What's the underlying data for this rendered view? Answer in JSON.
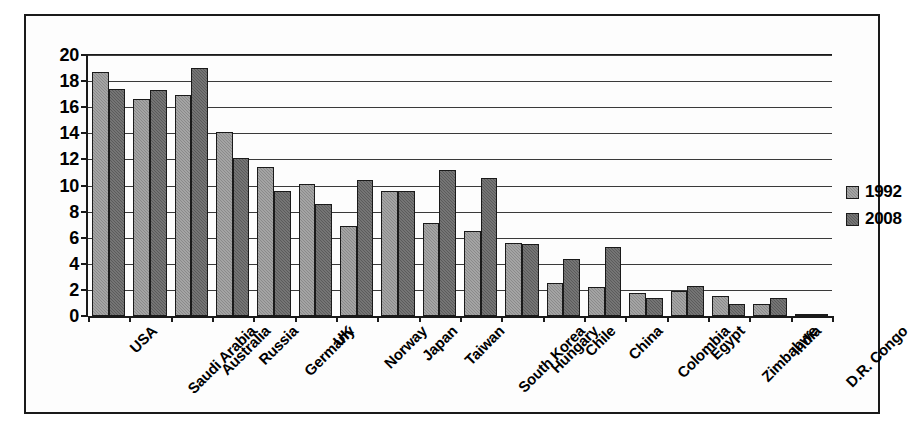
{
  "chart_data": {
    "type": "bar",
    "title": "",
    "subtitle": "",
    "xlabel": "",
    "ylabel": "",
    "ylim": [
      0,
      20
    ],
    "ytick_values": [
      0,
      2,
      4,
      6,
      8,
      10,
      12,
      14,
      16,
      18,
      20
    ],
    "ytick_labels": [
      "0",
      "2",
      "4",
      "6",
      "8",
      "10",
      "12",
      "14",
      "16",
      "18",
      "20"
    ],
    "grid": true,
    "grid_axis": "y",
    "legend_position": "right",
    "orientation": "vertical",
    "categories": [
      "USA",
      "Saudi Arabia",
      "Australia",
      "Russia",
      "Germany",
      "UK",
      "Norway",
      "Japan",
      "Taiwan",
      "South Korea",
      "Hungary",
      "Chile",
      "China",
      "Colombia",
      "Egypt",
      "Zimbabwe",
      "India",
      "D.R. Congo"
    ],
    "series": [
      {
        "name": "1992",
        "color": "#8a8a8a",
        "values": [
          18.7,
          16.6,
          16.9,
          14.1,
          11.4,
          10.1,
          6.9,
          9.6,
          7.1,
          6.5,
          5.6,
          2.5,
          2.2,
          1.8,
          1.9,
          1.5,
          0.9,
          0.05
        ]
      },
      {
        "name": "2008",
        "color": "#5b5b5b",
        "values": [
          17.4,
          17.3,
          19.0,
          12.1,
          9.6,
          8.6,
          10.4,
          9.6,
          11.2,
          10.6,
          5.5,
          4.4,
          5.3,
          1.4,
          2.3,
          0.9,
          1.4,
          0.05
        ]
      }
    ]
  },
  "legend": {
    "entries": [
      {
        "label": "1992"
      },
      {
        "label": "2008"
      }
    ]
  }
}
